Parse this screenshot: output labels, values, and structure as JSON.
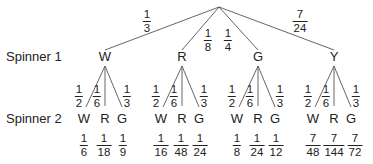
{
  "row_labels": {
    "spinner1": "Spinner 1",
    "spinner2": "Spinner 2"
  },
  "level1": [
    {
      "label": "W",
      "prob": {
        "num": "1",
        "den": "3"
      }
    },
    {
      "label": "R",
      "prob": {
        "num": "1",
        "den": "8"
      }
    },
    {
      "label": "G",
      "prob": {
        "num": "1",
        "den": "4"
      }
    },
    {
      "label": "Y",
      "prob": {
        "num": "7",
        "den": "24"
      }
    }
  ],
  "level2_branches": [
    {
      "label": "W",
      "prob": {
        "num": "1",
        "den": "2"
      }
    },
    {
      "label": "R",
      "prob": {
        "num": "1",
        "den": "6"
      }
    },
    {
      "label": "G",
      "prob": {
        "num": "1",
        "den": "3"
      }
    }
  ],
  "products": [
    [
      {
        "num": "1",
        "den": "6"
      },
      {
        "num": "1",
        "den": "18"
      },
      {
        "num": "1",
        "den": "9"
      }
    ],
    [
      {
        "num": "1",
        "den": "16"
      },
      {
        "num": "1",
        "den": "48"
      },
      {
        "num": "1",
        "den": "24"
      }
    ],
    [
      {
        "num": "1",
        "den": "8"
      },
      {
        "num": "1",
        "den": "24"
      },
      {
        "num": "1",
        "den": "12"
      }
    ],
    [
      {
        "num": "7",
        "den": "48"
      },
      {
        "num": "7",
        "den": "144"
      },
      {
        "num": "7",
        "den": "72"
      }
    ]
  ]
}
